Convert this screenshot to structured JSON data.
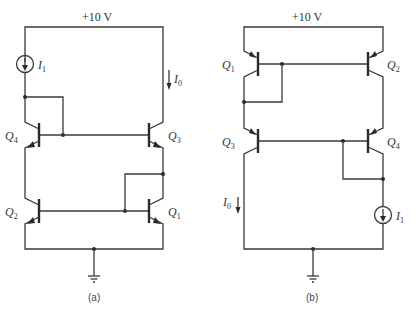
{
  "figure": {
    "circuit_a": {
      "supply_label": "+10 V",
      "caption": "(a)",
      "transistors": [
        {
          "name": "Q",
          "sub": "4",
          "type": "npn"
        },
        {
          "name": "Q",
          "sub": "3",
          "type": "npn"
        },
        {
          "name": "Q",
          "sub": "2",
          "type": "npn"
        },
        {
          "name": "Q",
          "sub": "1",
          "type": "npn"
        }
      ],
      "source": {
        "name": "I",
        "sub": "1"
      },
      "output_current": {
        "name": "I",
        "sub": "0"
      },
      "ground": "ground-icon"
    },
    "circuit_b": {
      "supply_label": "+10 V",
      "caption": "(b)",
      "transistors": [
        {
          "name": "Q",
          "sub": "1",
          "type": "pnp"
        },
        {
          "name": "Q",
          "sub": "2",
          "type": "pnp"
        },
        {
          "name": "Q",
          "sub": "3",
          "type": "pnp"
        },
        {
          "name": "Q",
          "sub": "4",
          "type": "pnp"
        }
      ],
      "source": {
        "name": "I",
        "sub": "1"
      },
      "output_current": {
        "name": "I",
        "sub": "0"
      },
      "ground": "ground-icon"
    },
    "colors": {
      "ink": "#333333",
      "background": "#ffffff"
    }
  }
}
